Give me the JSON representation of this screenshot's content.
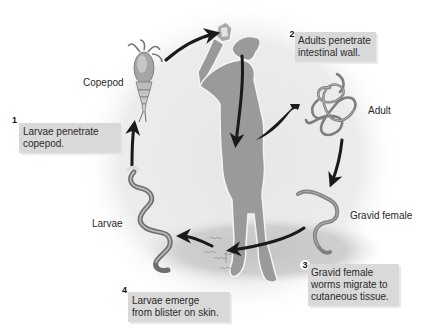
{
  "diagram": {
    "type": "life-cycle",
    "colors": {
      "background_circle": "#e8e8e8",
      "human_silhouette": "#9a9a9a",
      "worm": "#8c8c8c",
      "arrow": "#1a1a1a",
      "label_box": "#d9d9d9",
      "text": "#2a2a2a"
    },
    "organisms": [
      {
        "id": "copepod",
        "label": "Copepod"
      },
      {
        "id": "adult",
        "label": "Adult"
      },
      {
        "id": "gravid-female",
        "label": "Gravid female"
      },
      {
        "id": "larvae",
        "label": "Larvae"
      }
    ],
    "steps": [
      {
        "number": "1",
        "lines": [
          "Larvae penetrate",
          "copepod."
        ]
      },
      {
        "number": "2",
        "lines": [
          "Adults penetrate",
          "intestinal wall."
        ]
      },
      {
        "number": "3",
        "lines": [
          "Gravid female",
          "worms migrate to",
          "cutaneous tissue."
        ]
      },
      {
        "number": "4",
        "lines": [
          "Larvae emerge",
          "from blister on skin."
        ]
      }
    ],
    "flow": [
      "larvae",
      "copepod",
      "human (ingested)",
      "adult",
      "gravid-female",
      "larvae"
    ]
  }
}
